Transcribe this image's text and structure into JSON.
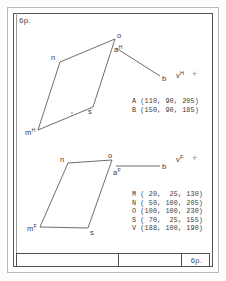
{
  "sheet": {
    "number_top": "6р.",
    "title_block_number": "6р."
  },
  "upper_projection": {
    "plane_suffix": "H",
    "vertices": [
      {
        "label": "o",
        "sup": ""
      },
      {
        "label": "n",
        "sup": ""
      },
      {
        "label": "m",
        "sup": "H"
      },
      {
        "label": "s",
        "sup": ""
      }
    ],
    "line_labels": [
      {
        "label": "a",
        "sup": "H"
      },
      {
        "label": "b",
        "sup": ""
      },
      {
        "label": "v",
        "sup": "H"
      }
    ],
    "cross_marker": "+",
    "point_table": [
      "A (110, 90, 205)",
      "B (150, 90, 185)"
    ]
  },
  "lower_projection": {
    "plane_suffix": "F",
    "vertices": [
      {
        "label": "o",
        "sup": ""
      },
      {
        "label": "n",
        "sup": ""
      },
      {
        "label": "m",
        "sup": "F"
      },
      {
        "label": "s",
        "sup": ""
      }
    ],
    "line_labels": [
      {
        "label": "a",
        "sup": "F"
      },
      {
        "label": "b",
        "sup": ""
      },
      {
        "label": "v",
        "sup": "F"
      }
    ],
    "cross_marker": "+",
    "point_table": [
      "M ( 20,  25, 130)",
      "N ( 50, 100, 205)",
      "O (100, 100, 230)",
      "S ( 70,  25, 155)",
      "V (188, 100, 190)"
    ]
  },
  "geometry": {
    "upper_parallelogram": [
      [
        115,
        39
      ],
      [
        60,
        62
      ],
      [
        38,
        130
      ],
      [
        93,
        107
      ]
    ],
    "upper_interior_dot": [
      72,
      113
    ],
    "upper_segment_a_b": [
      [
        116,
        48
      ],
      [
        160,
        76
      ]
    ],
    "lower_parallelogram": [
      [
        112,
        160
      ],
      [
        68,
        163
      ],
      [
        40,
        227
      ],
      [
        88,
        228
      ]
    ],
    "lower_segment_a_b": [
      [
        116,
        166
      ],
      [
        160,
        166
      ]
    ]
  },
  "colors": {
    "ink": "#3a3a3a",
    "frame": "#555555",
    "page_border": "#b9b9b9",
    "marker": "#8e8e8e",
    "background": "#ffffff"
  }
}
